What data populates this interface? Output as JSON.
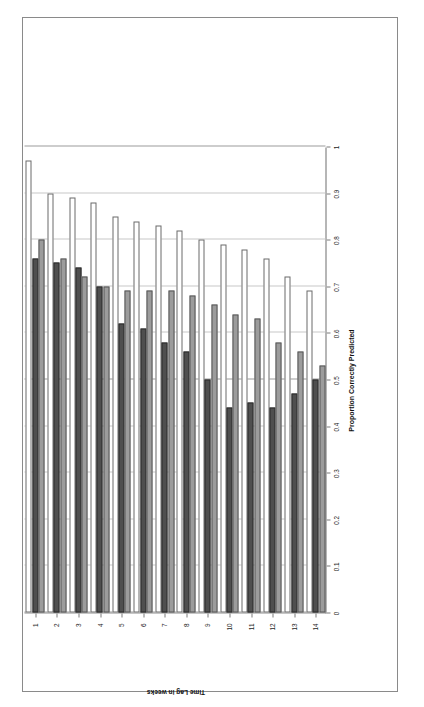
{
  "chart_data": {
    "type": "bar",
    "orientation": "horizontal",
    "title": "",
    "xlabel": "Proportion Correctly Predicted",
    "ylabel": "Time Lag in weeks",
    "ylabel_display": "Time Lag in weeks",
    "categories": [
      "1",
      "2",
      "3",
      "4",
      "5",
      "6",
      "7",
      "8",
      "9",
      "10",
      "11",
      "12",
      "13",
      "14"
    ],
    "xlim": [
      0,
      1
    ],
    "xticks": [
      "1",
      "0.9",
      "0.8",
      "0.7",
      "0.6",
      "0.5",
      "0.4",
      "0.3",
      "0.2",
      "0.1",
      "0"
    ],
    "grid": true,
    "legend_position": "top-right",
    "series": [
      {
        "name": "Asymmetric",
        "values": [
          0.8,
          0.76,
          0.72,
          0.7,
          0.69,
          0.69,
          0.69,
          0.68,
          0.66,
          0.64,
          0.63,
          0.58,
          0.56,
          0.53
        ]
      },
      {
        "name": "Sole Symmetric",
        "values": [
          0.76,
          0.75,
          0.74,
          0.7,
          0.62,
          0.61,
          0.58,
          0.56,
          0.5,
          0.44,
          0.45,
          0.44,
          0.47,
          0.5
        ]
      },
      {
        "name": "Simmelian",
        "values": [
          0.97,
          0.9,
          0.89,
          0.88,
          0.85,
          0.84,
          0.83,
          0.82,
          0.8,
          0.79,
          0.78,
          0.76,
          0.72,
          0.69
        ]
      }
    ],
    "series_colors": [
      "#9c9c9c",
      "#4f4f4f",
      "#ffffff"
    ]
  },
  "axis": {
    "value_axis_title": "Proportion Correctly Predicted",
    "category_axis_title": "Time Lag in weeks",
    "arrow_left": "←",
    "arrow_right": "→"
  }
}
